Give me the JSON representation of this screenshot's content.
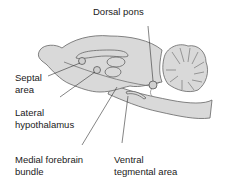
{
  "labels": {
    "dorsal_pons": "Dorsal pons",
    "septal_area_1": "Septal",
    "septal_area_2": "area",
    "lateral_hypothalamus_1": "Lateral",
    "lateral_hypothalamus_2": "hypothalamus",
    "medial_forebrain_bundle_1": "Medial forebrain",
    "medial_forebrain_bundle_2": "bundle",
    "ventral_tegmental_area_1": "Ventral",
    "ventral_tegmental_area_2": "tegmental area"
  },
  "colors": {
    "brain_fill": "#d9d9d9",
    "outline": "#555555",
    "text": "#1a1a1a",
    "background": "#ffffff"
  }
}
